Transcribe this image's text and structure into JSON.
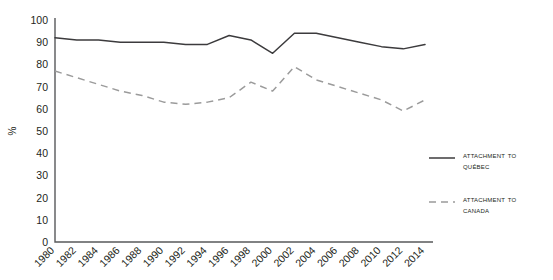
{
  "chart_data": {
    "type": "line",
    "title": "",
    "xlabel": "",
    "ylabel": "%",
    "ylim": [
      0,
      100
    ],
    "ytick_step": 10,
    "grid": false,
    "legend_position": "right",
    "categories": [
      "1980",
      "1982",
      "1984",
      "1986",
      "1988",
      "1990",
      "1992",
      "1994",
      "1996",
      "1998",
      "2000",
      "2002",
      "2004",
      "2006",
      "2008",
      "2010",
      "2012",
      "2014"
    ],
    "yticks": [
      "0",
      "10",
      "20",
      "30",
      "40",
      "50",
      "60",
      "70",
      "80",
      "90",
      "100"
    ],
    "series": [
      {
        "name": "Attachment to Québec",
        "style": "solid",
        "color": "#3c3b3d",
        "values": [
          92,
          91,
          91,
          90,
          90,
          90,
          89,
          89,
          93,
          91,
          85,
          94,
          94,
          92,
          90,
          88,
          87,
          89
        ]
      },
      {
        "name": "Attachment to Canada",
        "style": "dashed",
        "color": "#9b9b9b",
        "values": [
          77,
          74,
          71,
          68,
          66,
          63,
          62,
          63,
          65,
          72,
          68,
          79,
          73,
          70,
          67,
          64,
          59,
          64
        ]
      }
    ]
  },
  "legend": {
    "items": [
      {
        "label_line1": "Attachment to",
        "label_line2": "Québec",
        "style": "solid"
      },
      {
        "label_line1": "Attachment to",
        "label_line2": "Canada",
        "style": "dashed"
      }
    ]
  },
  "axis": {
    "y_title": "%"
  }
}
